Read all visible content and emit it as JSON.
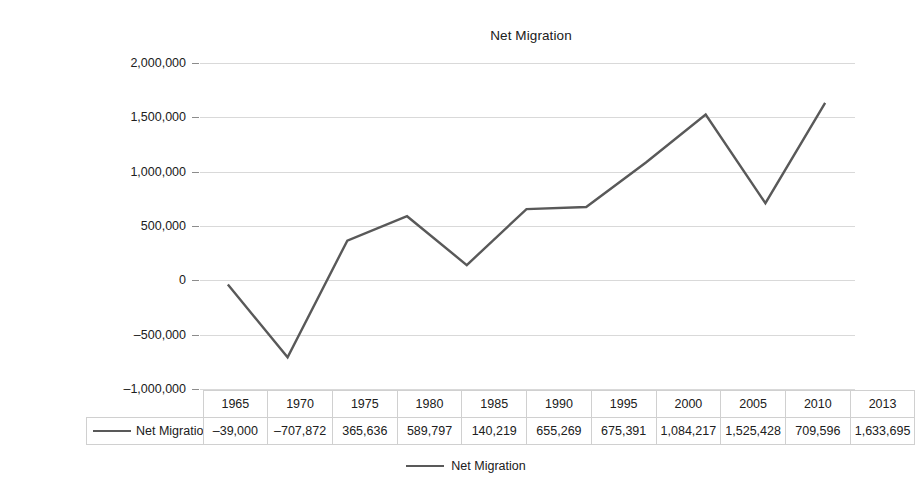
{
  "chart_data": {
    "type": "line",
    "title": "Net Migration",
    "xlabel": "",
    "ylabel": "",
    "categories": [
      "1965",
      "1970",
      "1975",
      "1980",
      "1985",
      "1990",
      "1995",
      "2000",
      "2005",
      "2010",
      "2013"
    ],
    "series": [
      {
        "name": "Net Migration",
        "values": [
          -39000,
          -707872,
          365636,
          589797,
          140219,
          655269,
          675391,
          1084217,
          1525428,
          709596,
          1633695
        ],
        "value_labels": [
          "–39,000",
          "–707,872",
          "365,636",
          "589,797",
          "140,219",
          "655,269",
          "675,391",
          "1,084,217",
          "1,525,428",
          "709,596",
          "1,633,695"
        ],
        "color": "#595959"
      }
    ],
    "ylim": [
      -1000000,
      2000000
    ],
    "ytick_values": [
      2000000,
      1500000,
      1000000,
      500000,
      0,
      -500000,
      -1000000
    ],
    "ytick_labels": [
      "2,000,000",
      "1,500,000",
      "1,000,000",
      "500,000",
      "0",
      "–500,000",
      "–1,000,000"
    ],
    "grid": true,
    "legend_position": "bottom",
    "data_table_visible": true
  },
  "legend": {
    "entries": [
      {
        "label": "Net Migration",
        "color": "#595959"
      }
    ]
  },
  "table": {
    "row_header_label": "Net Migration"
  },
  "colors": {
    "series": "#595959",
    "gridline": "#d9d9d9",
    "table_border": "#d0d0d0",
    "text": "#202020",
    "background": "#ffffff"
  }
}
